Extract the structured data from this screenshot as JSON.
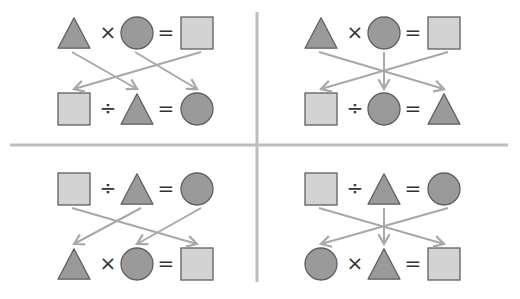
{
  "colors": {
    "shape_fill_dark": "#9a9a9a",
    "shape_fill_light": "#d3d3d3",
    "shape_stroke": "#5f5f5f",
    "arrow": "#a8a8a8",
    "divider": "#bdbdbd",
    "operator": "#333333"
  },
  "panels": [
    {
      "name": "top-left",
      "top_equation": [
        "triangle",
        "×",
        "circle",
        "=",
        "square"
      ],
      "bottom_equation": [
        "square",
        "÷",
        "triangle",
        "=",
        "circle"
      ],
      "arrows": [
        [
          0,
          2
        ],
        [
          2,
          4
        ],
        [
          4,
          0
        ]
      ]
    },
    {
      "name": "top-right",
      "top_equation": [
        "triangle",
        "×",
        "circle",
        "=",
        "square"
      ],
      "bottom_equation": [
        "square",
        "÷",
        "circle",
        "=",
        "triangle"
      ],
      "arrows": [
        [
          0,
          4
        ],
        [
          2,
          2
        ],
        [
          4,
          0
        ]
      ]
    },
    {
      "name": "bottom-left",
      "top_equation": [
        "square",
        "÷",
        "triangle",
        "=",
        "circle"
      ],
      "bottom_equation": [
        "triangle",
        "×",
        "circle",
        "=",
        "square"
      ],
      "arrows": [
        [
          0,
          4
        ],
        [
          2,
          0
        ],
        [
          4,
          2
        ]
      ]
    },
    {
      "name": "bottom-right",
      "top_equation": [
        "square",
        "÷",
        "triangle",
        "=",
        "circle"
      ],
      "bottom_equation": [
        "circle",
        "×",
        "triangle",
        "=",
        "square"
      ],
      "arrows": [
        [
          0,
          4
        ],
        [
          2,
          2
        ],
        [
          4,
          0
        ]
      ]
    }
  ]
}
